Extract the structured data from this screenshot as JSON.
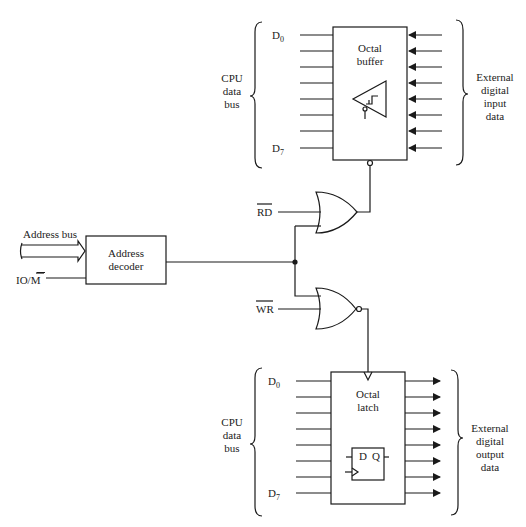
{
  "diagram": {
    "type": "io-interface-block-diagram",
    "input_section": {
      "bus_label": [
        "CPU",
        "data",
        "bus"
      ],
      "first_bit": "D0",
      "last_bit": "D7",
      "device_label": [
        "Octal",
        "buffer"
      ],
      "external_label": [
        "External",
        "digital",
        "input",
        "data"
      ],
      "lines": 8
    },
    "output_section": {
      "bus_label": [
        "CPU",
        "data",
        "bus"
      ],
      "first_bit": "D0",
      "last_bit": "D7",
      "device_label": [
        "Octal",
        "latch"
      ],
      "flipflop": {
        "d": "D",
        "q": "Q"
      },
      "external_label": [
        "External",
        "digital",
        "output",
        "data"
      ],
      "lines": 8
    },
    "decoder": {
      "label": [
        "Address",
        "decoder"
      ],
      "address_bus_label": "Address bus",
      "io_m_label": "IO/M"
    },
    "gates": {
      "read_signal": "RD",
      "write_signal": "WR",
      "read_gate": "OR",
      "write_gate": "NOR"
    }
  }
}
